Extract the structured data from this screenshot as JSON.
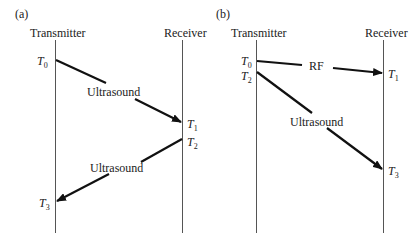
{
  "panels": [
    {
      "id": "a",
      "label": "(a)",
      "transmitter_label": "Transmitter",
      "receiver_label": "Receiver",
      "times": {
        "t0": {
          "base": "T",
          "sub": "0"
        },
        "t1": {
          "base": "T",
          "sub": "1"
        },
        "t2": {
          "base": "T",
          "sub": "2"
        },
        "t3": {
          "base": "T",
          "sub": "3"
        }
      },
      "signals": [
        {
          "label": "Ultrasound",
          "from": "Transmitter T0",
          "to": "Receiver T1"
        },
        {
          "label": "Ultrasound",
          "from": "Receiver T2",
          "to": "Transmitter T3"
        }
      ]
    },
    {
      "id": "b",
      "label": "(b)",
      "transmitter_label": "Transmitter",
      "receiver_label": "Receiver",
      "times": {
        "t0": {
          "base": "T",
          "sub": "0"
        },
        "t1": {
          "base": "T",
          "sub": "1"
        },
        "t2": {
          "base": "T",
          "sub": "2"
        },
        "t3": {
          "base": "T",
          "sub": "3"
        }
      },
      "signals": [
        {
          "label": "RF",
          "from": "Transmitter T0",
          "to": "Receiver T1"
        },
        {
          "label": "Ultrasound",
          "from": "Transmitter T2",
          "to": "Receiver T3"
        }
      ]
    }
  ],
  "colors": {
    "line": "#222222",
    "timeline": "#555555",
    "background": "#ffffff"
  }
}
